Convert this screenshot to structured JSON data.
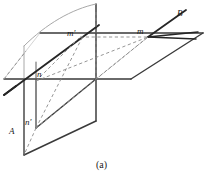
{
  "figure": {
    "caption": "(a)",
    "caption_pos": {
      "x": 95,
      "y": 161
    },
    "width": 211,
    "height": 181,
    "background": "#ffffff",
    "stroke_solid": "#3a3a3a",
    "stroke_heavy": "#262626",
    "stroke_dashed": "#8a8a8a",
    "stroke_light": "#a8a8a8"
  },
  "labels": [
    {
      "id": "label-B",
      "text": "B",
      "x": 177,
      "y": 9,
      "italic": true
    },
    {
      "id": "label-m-prime",
      "text": "m'",
      "x": 67,
      "y": 33,
      "italic": true
    },
    {
      "id": "label-m",
      "text": "m",
      "x": 138,
      "y": 31,
      "italic": true
    },
    {
      "id": "label-n",
      "text": "n",
      "x": 37,
      "y": 74,
      "italic": true
    },
    {
      "id": "label-n-prime",
      "text": "n'",
      "x": 25,
      "y": 122,
      "italic": true
    },
    {
      "id": "label-A",
      "text": "A",
      "x": 10,
      "y": 131,
      "italic": true
    }
  ],
  "geometry": {
    "description": "Two intersecting planes: a vertical plane (with curved top edge) and a horizontal plane. Line A runs from lower-left through n and m' toward the upper right; line B lies in the horizontal plane passing through m. Dashed construction lines connect m, m', n, n'.",
    "points": {
      "m_prime": {
        "x": 80,
        "y": 37
      },
      "m": {
        "x": 148,
        "y": 37
      },
      "n": {
        "x": 36,
        "y": 81
      },
      "n_prime": {
        "x": 36,
        "y": 128
      }
    },
    "horizontal_plane": {
      "far_left": {
        "x": 96,
        "y": 33
      },
      "far_right": {
        "x": 203,
        "y": 33
      },
      "near_right": {
        "x": 131,
        "y": 79
      },
      "near_left": {
        "x": 8,
        "y": 79
      }
    },
    "vertical_plane_upper": {
      "top_right": {
        "x": 96,
        "y": 4
      },
      "bot_right": {
        "x": 96,
        "y": 79
      },
      "bot_left": {
        "x": 24,
        "y": 79
      },
      "top_left": {
        "x": 24,
        "y": 46
      }
    },
    "vertical_plane_lower": {
      "top_left": {
        "x": 24,
        "y": 79
      },
      "top_right": {
        "x": 96,
        "y": 79
      },
      "bot_right": {
        "x": 96,
        "y": 121
      },
      "bot_left": {
        "x": 24,
        "y": 155
      }
    },
    "line_A": {
      "from": {
        "x": 4,
        "y": 95
      },
      "to": {
        "x": 99,
        "y": 25
      }
    },
    "line_B": {
      "from": {
        "x": 186,
        "y": 10
      },
      "to": {
        "x": 148,
        "y": 37
      }
    }
  }
}
